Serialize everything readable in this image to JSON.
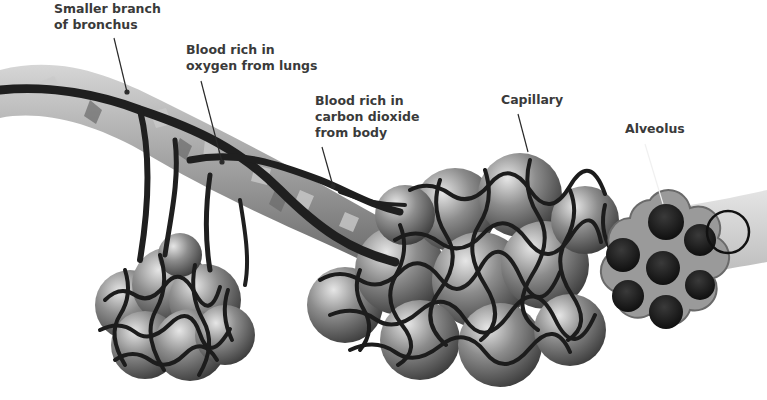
{
  "diagram": {
    "colors": {
      "background": "#ffffff",
      "label_text": "#3a3a3a",
      "vessel": "#1f1f1f",
      "bronchus_light": "#b9b9b9",
      "bronchus_dark": "#6f6f6f",
      "alveolus_fill": "#7a7a7a",
      "alveolus_rim": "#9a9a9a",
      "alveolus_cavity": "#161616"
    },
    "labels": [
      {
        "id": "smaller-branch-of-bronchus",
        "lines": [
          "Smaller branch",
          "of bronchus"
        ],
        "x": 54,
        "y": 1,
        "leader": {
          "x1": 114,
          "y1": 38,
          "x2": 127,
          "y2": 92
        }
      },
      {
        "id": "blood-rich-in-oxygen",
        "lines": [
          "Blood rich in",
          "oxygen from lungs"
        ],
        "x": 186,
        "y": 42,
        "leader": {
          "x1": 201,
          "y1": 81,
          "x2": 222,
          "y2": 162
        }
      },
      {
        "id": "blood-rich-in-carbon-dioxide",
        "lines": [
          "Blood rich in",
          "carbon dioxide",
          "from body"
        ],
        "x": 315,
        "y": 93,
        "leader": {
          "x1": 322,
          "y1": 147,
          "x2": 333,
          "y2": 186
        }
      },
      {
        "id": "capillary",
        "lines": [
          "Capillary"
        ],
        "x": 501,
        "y": 92,
        "leader": {
          "x1": 518,
          "y1": 114,
          "x2": 528,
          "y2": 152
        }
      },
      {
        "id": "alveolus",
        "lines": [
          "Alveolus"
        ],
        "x": 625,
        "y": 121,
        "leader": {
          "x1": 645,
          "y1": 144,
          "x2": 663,
          "y2": 204
        }
      }
    ]
  }
}
